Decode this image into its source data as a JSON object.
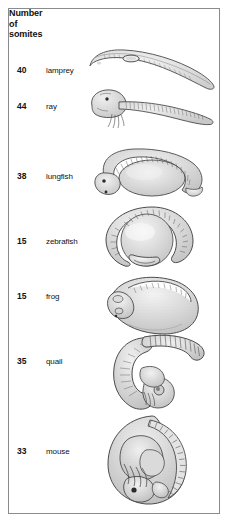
{
  "figure": {
    "header_lines": [
      "Number",
      "of",
      "somites"
    ],
    "border_color": "#8b8b8b",
    "background_color": "#ffffff",
    "ink_color": "#111111",
    "art_fill": "#dedede",
    "art_outline": "#4a4a4a"
  },
  "columns": {
    "count_header": "Number of somites",
    "name_header": ""
  },
  "rows": [
    {
      "somites": "40",
      "organism": "lamprey",
      "art": "lamprey-embryo-illustration"
    },
    {
      "somites": "44",
      "organism": "ray",
      "art": "ray-embryo-illustration"
    },
    {
      "somites": "38",
      "organism": "lungfish",
      "art": "lungfish-embryo-illustration"
    },
    {
      "somites": "15",
      "organism": "zebrafish",
      "art": "zebrafish-embryo-illustration"
    },
    {
      "somites": "15",
      "organism": "frog",
      "art": "frog-embryo-illustration"
    },
    {
      "somites": "35",
      "organism": "quail",
      "art": "quail-embryo-illustration"
    },
    {
      "somites": "33",
      "organism": "mouse",
      "art": "mouse-embryo-illustration"
    }
  ]
}
